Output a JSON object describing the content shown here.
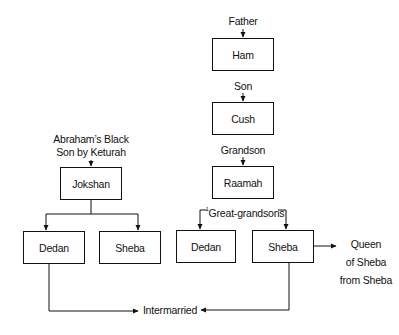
{
  "diagram": {
    "right_lineage": {
      "father_label": "Father",
      "ham": "Ham",
      "son_label": "Son",
      "cush": "Cush",
      "grandson_label": "Grandson",
      "raamah": "Raamah",
      "great_grandsons_label": "Great-grandsons",
      "great_grandsons_marker": "1",
      "dedan": "Dedan",
      "sheba": "Sheba",
      "queen_label_line1": "Queen",
      "queen_label_line2": "of Sheba",
      "queen_label_line3": "from Sheba"
    },
    "left_lineage": {
      "heading_line1": "Abraham’s Black",
      "heading_line2": "Son by Keturah",
      "jokshan": "Jokshan",
      "dedan": "Dedan",
      "sheba": "Sheba"
    },
    "intermarried_label": "Intermarried"
  }
}
